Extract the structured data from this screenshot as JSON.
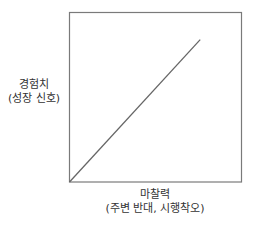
{
  "chart_data": {
    "type": "line",
    "title": "",
    "xlabel": "마찰력\n(주변 반대, 시행착오)",
    "ylabel": "경험치\n(성장 신호)",
    "xlabel_lines": [
      "마찰력",
      "(주변 반대, 시행착오)"
    ],
    "ylabel_lines": [
      "경험치",
      "(성장 신호)"
    ],
    "x": [
      0,
      0.76
    ],
    "series": [
      {
        "name": "경험치 vs 마찰력",
        "values": [
          0,
          0.84
        ]
      }
    ],
    "xlim": [
      0,
      1
    ],
    "ylim": [
      0,
      1
    ],
    "grid": false,
    "legend": "none",
    "ticks": "none"
  },
  "colors": {
    "frame": "#7a7a7a",
    "line": "#666666",
    "text": "#333333"
  }
}
